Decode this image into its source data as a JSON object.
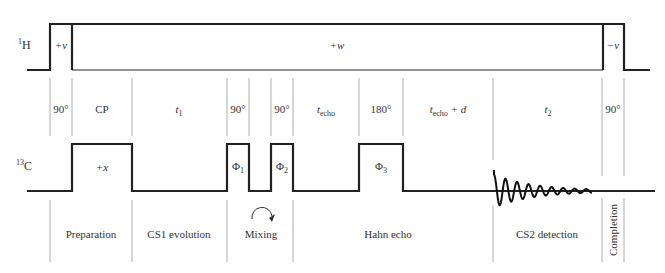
{
  "channels": {
    "proton": {
      "label_sup": "1",
      "label": "H"
    },
    "carbon": {
      "label_sup": "13",
      "label": "C"
    }
  },
  "proton_pulses": [
    {
      "label": "+v"
    },
    {
      "label": "+w"
    },
    {
      "label": "−v"
    }
  ],
  "carbon_pulses": [
    {
      "label": "+x",
      "sub": ""
    },
    {
      "label": "Φ",
      "sub": "1"
    },
    {
      "label": "Φ",
      "sub": "2"
    },
    {
      "label": "Φ",
      "sub": "3"
    }
  ],
  "intervals": [
    {
      "main": "90°",
      "sub": "",
      "suffix": ""
    },
    {
      "main": "CP",
      "sub": "",
      "suffix": ""
    },
    {
      "main": "t",
      "sub": "1",
      "suffix": ""
    },
    {
      "main": "90°",
      "sub": "",
      "suffix": ""
    },
    {
      "main": "90°",
      "sub": "",
      "suffix": ""
    },
    {
      "main": "t",
      "sub": "echo",
      "suffix": ""
    },
    {
      "main": "180°",
      "sub": "",
      "suffix": ""
    },
    {
      "main": "t",
      "sub": "echo",
      "suffix": " + d"
    },
    {
      "main": "t",
      "sub": "2",
      "suffix": ""
    },
    {
      "main": "90°",
      "sub": "",
      "suffix": ""
    }
  ],
  "stages": [
    {
      "label": "Preparation"
    },
    {
      "label": "CS1 evolution"
    },
    {
      "label": "Mixing"
    },
    {
      "label": "Hahn echo"
    },
    {
      "label": "CS2 detection"
    },
    {
      "label": "Completion"
    }
  ],
  "mixing_icon": "circular-arrow-clockwise",
  "detection_signal": "free-induction-decay"
}
